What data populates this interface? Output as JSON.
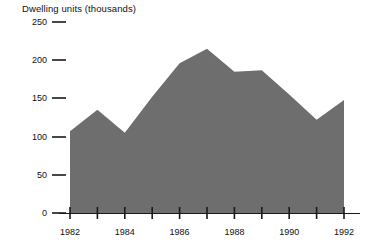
{
  "chart_data": {
    "type": "area",
    "title": "Dwelling units (thousands)",
    "xlabel": "",
    "ylabel": "",
    "ylim": [
      0,
      250
    ],
    "xlim": [
      1982,
      1992
    ],
    "grid": false,
    "legend": null,
    "fill_color": "#6e6e6e",
    "axis_color": "#1a1a1a",
    "yticks": [
      0,
      50,
      100,
      150,
      200,
      250
    ],
    "ytick_labels": [
      "0",
      "50",
      "100",
      "150",
      "200",
      "250"
    ],
    "xticks": [
      1982,
      1983,
      1984,
      1985,
      1986,
      1987,
      1988,
      1989,
      1990,
      1991,
      1992
    ],
    "xtick_labels": [
      "1982",
      "",
      "1984",
      "",
      "1986",
      "",
      "1988",
      "",
      "1990",
      "",
      "1992"
    ],
    "x": [
      1982,
      1983,
      1984,
      1985,
      1986,
      1987,
      1988,
      1989,
      1990,
      1991,
      1992
    ],
    "values": [
      107,
      135,
      105,
      152,
      196,
      215,
      185,
      187,
      155,
      122,
      148
    ],
    "series": [
      {
        "name": "Dwelling units",
        "values": [
          107,
          135,
          105,
          152,
          196,
          215,
          185,
          187,
          155,
          122,
          148
        ]
      }
    ]
  }
}
